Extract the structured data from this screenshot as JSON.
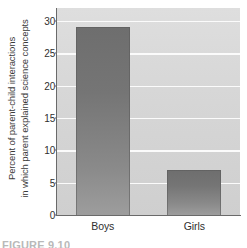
{
  "chart_data": {
    "type": "bar",
    "title": "",
    "xlabel": "",
    "ylabel_line1": "Percent of parent-child interactions",
    "ylabel_line2": "in which parent explained science concepts",
    "categories": [
      "Boys",
      "Girls"
    ],
    "values": [
      29,
      7
    ],
    "ylim": [
      0,
      32
    ],
    "yticks": [
      0,
      5,
      10,
      15,
      20,
      25,
      30
    ],
    "ytick_labels": [
      "0",
      "5",
      "10",
      "15",
      "20",
      "25",
      "30"
    ],
    "grid": true,
    "grid_axis": "y",
    "legend": "none",
    "series": [
      {
        "name": "Percent of parent-child interactions in which parent explained science concepts",
        "values": [
          29,
          7
        ]
      }
    ]
  },
  "figure": {
    "caption": "FIGURE 9.10",
    "plot_background_color": "#d6d6d6",
    "gridline_color": "#fbfbfb",
    "bar_color_top": "#6e6e6e",
    "bar_color_bottom": "#9d9d9d",
    "axis_color": "#6a6a6a",
    "text_color": "#2f2f2f"
  }
}
